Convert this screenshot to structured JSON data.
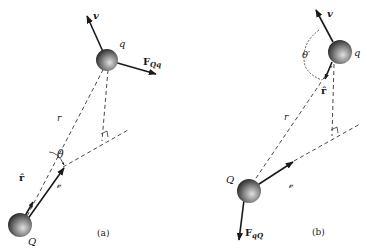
{
  "figure": {
    "panel_a": {
      "caption": "(a)",
      "charge_moving": "q",
      "charge_source": "Q",
      "velocity_label": "v",
      "force_label_main": "F",
      "force_label_sub": "Qq",
      "separation_label": "r",
      "separation_vector_label": "𝓋",
      "unit_vector_label": "r̂",
      "angle_label": "θ"
    },
    "panel_b": {
      "caption": "(b)",
      "charge_moving": "q",
      "charge_source": "Q",
      "velocity_label": "v",
      "force_label_main": "F",
      "force_label_sub": "qQ",
      "separation_label": "r",
      "separation_vector_label": "𝓋",
      "unit_vector_label": "r̂",
      "angle_label": "θ′"
    },
    "colors": {
      "line": "#1a1a1a",
      "sphere_light": "#d8d8d8",
      "sphere_dark": "#2a2a2a"
    }
  }
}
